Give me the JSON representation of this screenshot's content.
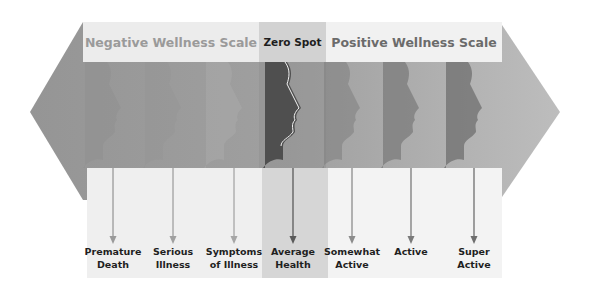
{
  "diagram": {
    "type": "wellness-continuum",
    "header": {
      "negative_label": "Negative Wellness Scale",
      "zero_label": "Zero Spot",
      "positive_label": "Positive Wellness Scale"
    },
    "stages": [
      {
        "line1": "Premature",
        "line2": "Death",
        "x": 113,
        "tone": "#8f8f8f",
        "arrow": "#9a9a9a"
      },
      {
        "line1": "Serious",
        "line2": "Illness",
        "x": 173,
        "tone": "#959595",
        "arrow": "#a0a0a0"
      },
      {
        "line1": "Symptoms",
        "line2": "of Illness",
        "x": 234,
        "tone": "#a9a9a9",
        "arrow": "#a6a6a6"
      },
      {
        "line1": "Average",
        "line2": "Health",
        "x": 293,
        "tone": "#4f4f4f",
        "arrow": "#5a5a5a"
      },
      {
        "line1": "Somewhat",
        "line2": "Active",
        "x": 352,
        "tone": "#7e7e7e",
        "arrow": "#8c8c8c"
      },
      {
        "line1": "Active",
        "line2": "",
        "x": 411,
        "tone": "#6a6a6a",
        "arrow": "#7a7a7a"
      },
      {
        "line1": "Super",
        "line2": "Active",
        "x": 474,
        "tone": "#555555",
        "arrow": "#6e6e6e"
      }
    ],
    "colors": {
      "arrow_body": "#a3a3a3",
      "arrow_body_left": "#999999",
      "arrow_body_right": "#b8b8b8",
      "header_negative_bg": "#ececec",
      "header_zero_bg": "#d2d2d2",
      "header_positive_bg": "#f1f1f1",
      "panel_zero_bg": "#d6d6d6"
    }
  }
}
